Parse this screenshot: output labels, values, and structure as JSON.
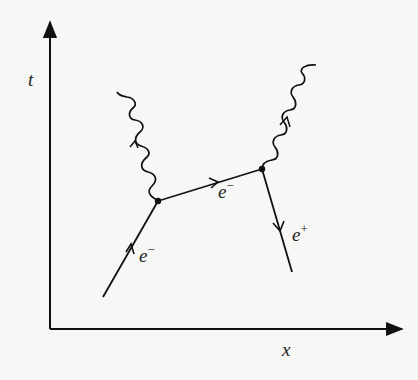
{
  "diagram": {
    "type": "feynman-diagram",
    "axes": {
      "vertical_label": "t",
      "horizontal_label": "x"
    },
    "vertices": [
      {
        "id": "A",
        "x": 158,
        "y": 201
      },
      {
        "id": "B",
        "x": 262,
        "y": 169
      }
    ],
    "fermion_lines": [
      {
        "id": "incoming-electron",
        "label_base": "e",
        "label_sup": "−",
        "from": "start",
        "to": "A",
        "arrow_direction": "up"
      },
      {
        "id": "internal-electron",
        "label_base": "e",
        "label_sup": "−",
        "from": "A",
        "to": "B",
        "arrow_direction": "right"
      },
      {
        "id": "positron",
        "label_base": "e",
        "label_sup": "+",
        "from": "B",
        "to": "end",
        "arrow_direction": "down"
      }
    ],
    "photon_lines": [
      {
        "id": "photon-1",
        "from": "A",
        "arrow_direction": "up"
      },
      {
        "id": "photon-2",
        "from": "B",
        "arrow_direction": "up"
      }
    ],
    "colors": {
      "ink": "#111111",
      "background": "#f7f7f5"
    }
  }
}
